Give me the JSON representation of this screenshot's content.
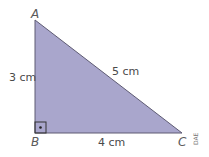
{
  "figure": {
    "vertices": {
      "A": "A",
      "B": "B",
      "C": "C"
    },
    "sides": {
      "AB": "3 cm",
      "BC": "4 cm",
      "AC": "5 cm"
    },
    "right_angle_at": "B",
    "credit": "DAE",
    "fill_color": "#a9a6cc",
    "stroke_color": "#5e5b73"
  }
}
